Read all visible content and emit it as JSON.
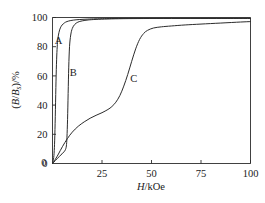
{
  "chart_data": {
    "type": "line",
    "title": "",
    "subtitle": "",
    "xlabel_parts": {
      "symbol": "H",
      "unit": "/kOe"
    },
    "xlabel": "H/kOe",
    "ylabel_parts": {
      "open": "(",
      "b": "B",
      "slash": "/",
      "bs_main": "B",
      "bs_sub": "s",
      "close": ")/%"
    },
    "ylabel": "(B/Bs)/%",
    "xlim": [
      0,
      100
    ],
    "ylim": [
      0,
      100
    ],
    "xticks": [
      "0",
      "25",
      "50",
      "75",
      "100"
    ],
    "xtick_values": [
      0,
      25,
      50,
      75,
      100
    ],
    "yticks": [
      "0",
      "20",
      "40",
      "60",
      "80",
      "100"
    ],
    "ytick_values": [
      0,
      20,
      40,
      60,
      80,
      100
    ],
    "grid": false,
    "legend_position": "inline-annotations",
    "line_color": "#2b2b2b",
    "frame_color": "#2b2b2b",
    "background_color": "#ffffff",
    "series": [
      {
        "name": "A",
        "label": "A",
        "label_x": 3.0,
        "label_y": 82.0,
        "x": [
          0,
          0.4,
          0.8,
          1.1,
          1.4,
          1.7,
          2.0,
          2.3,
          2.6,
          3.0,
          3.6,
          4.4,
          5.4,
          6.6,
          8.2,
          10.5,
          13.5,
          17.5,
          22.0,
          30.0,
          45.0,
          60.0,
          75.0,
          90.0,
          100.0
        ],
        "y": [
          0,
          2.0,
          7.0,
          16.0,
          32.0,
          52.0,
          68.0,
          78.0,
          84.0,
          88.0,
          91.5,
          94.0,
          95.6,
          96.8,
          97.6,
          98.2,
          98.6,
          98.9,
          99.1,
          99.3,
          99.4,
          99.4,
          99.4,
          99.4,
          99.4
        ]
      },
      {
        "name": "B",
        "label": "B",
        "label_x": 10.5,
        "label_y": 60.0,
        "x": [
          0,
          0.6,
          1.4,
          2.4,
          3.6,
          4.8,
          5.8,
          6.5,
          7.0,
          7.3,
          7.6,
          7.9,
          8.2,
          8.6,
          9.2,
          10.0,
          11.2,
          12.8,
          15.0,
          18.0,
          22.0,
          28.0,
          36.0,
          46.0,
          60.0,
          80.0,
          100.0
        ],
        "y": [
          0,
          0.8,
          2.0,
          3.4,
          5.0,
          6.6,
          8.0,
          9.4,
          12.0,
          18.0,
          30.0,
          48.0,
          66.0,
          80.0,
          88.0,
          92.5,
          95.2,
          96.8,
          97.7,
          98.3,
          98.7,
          99.0,
          99.2,
          99.3,
          99.4,
          99.4,
          99.4
        ]
      },
      {
        "name": "C",
        "label": "C",
        "label_x": 41.0,
        "label_y": 55.5,
        "x": [
          0,
          1.5,
          3.0,
          5.0,
          7.5,
          10.0,
          13.0,
          16.0,
          19.0,
          22.0,
          25.0,
          28.0,
          30.0,
          32.0,
          34.0,
          36.0,
          38.0,
          40.0,
          42.0,
          44.0,
          46.0,
          48.0,
          51.0,
          55.0,
          60.0,
          67.0,
          75.0,
          85.0,
          95.0,
          100.0
        ],
        "y": [
          0,
          3.0,
          6.5,
          11.5,
          17.0,
          21.5,
          25.5,
          28.5,
          31.0,
          33.0,
          34.8,
          37.0,
          39.0,
          42.0,
          46.5,
          53.0,
          61.0,
          70.0,
          78.5,
          85.0,
          89.0,
          91.2,
          92.8,
          93.6,
          94.2,
          94.9,
          95.5,
          96.2,
          96.9,
          97.2
        ]
      }
    ]
  }
}
